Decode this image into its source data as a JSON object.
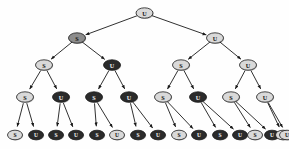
{
  "figure": {
    "background": "#fefefe",
    "edge_color": "#1a1a1a",
    "node_outline": "#1a1a1a"
  },
  "palette": {
    "light": "#d9d9d9",
    "medium": "#8c8c8c",
    "dark": "#2b2b2b",
    "text_on_light": "#111111",
    "text_on_medium": "#111111",
    "text_on_dark": "#f2f2f2"
  },
  "labels": {
    "s": "S",
    "u": "U"
  },
  "levels": [
    {
      "index": 0,
      "y": 13,
      "nodes": [
        {
          "id": "n0",
          "label": "U",
          "shade": "light",
          "x": 144.5
        }
      ]
    },
    {
      "index": 1,
      "y": 38,
      "nodes": [
        {
          "id": "n1",
          "label": "S",
          "shade": "medium",
          "x": 77
        },
        {
          "id": "n2",
          "label": "U",
          "shade": "light",
          "x": 215
        }
      ]
    },
    {
      "index": 2,
      "y": 65,
      "nodes": [
        {
          "id": "n3",
          "label": "S",
          "shade": "light",
          "x": 44
        },
        {
          "id": "n4",
          "label": "U",
          "shade": "dark",
          "x": 112
        },
        {
          "id": "n5",
          "label": "S",
          "shade": "light",
          "x": 181
        },
        {
          "id": "n6",
          "label": "U",
          "shade": "light",
          "x": 248
        }
      ]
    },
    {
      "index": 3,
      "y": 97,
      "nodes": [
        {
          "id": "n7",
          "label": "S",
          "shade": "light",
          "x": 25
        },
        {
          "id": "n8",
          "label": "U",
          "shade": "dark",
          "x": 61
        },
        {
          "id": "n9",
          "label": "S",
          "shade": "dark",
          "x": 94
        },
        {
          "id": "n10",
          "label": "U",
          "shade": "dark",
          "x": 129
        },
        {
          "id": "n11",
          "label": "S",
          "shade": "light",
          "x": 163
        },
        {
          "id": "n12",
          "label": "U",
          "shade": "dark",
          "x": 198
        },
        {
          "id": "n13",
          "label": "S",
          "shade": "light",
          "x": 231
        },
        {
          "id": "n14",
          "label": "U",
          "shade": "light",
          "x": 265
        }
      ]
    },
    {
      "index": 4,
      "y": 135,
      "nodes": [
        {
          "id": "n15",
          "label": "S",
          "shade": "light",
          "x": 15
        },
        {
          "id": "n16",
          "label": "U",
          "shade": "dark",
          "x": 36
        },
        {
          "id": "n17",
          "label": "S",
          "shade": "dark",
          "x": 56
        },
        {
          "id": "n18",
          "label": "U",
          "shade": "dark",
          "x": 76
        },
        {
          "id": "n19",
          "label": "S",
          "shade": "dark",
          "x": 97
        },
        {
          "id": "n20",
          "label": "U",
          "shade": "light",
          "x": 117
        },
        {
          "id": "n21",
          "label": "S",
          "shade": "dark",
          "x": 138
        },
        {
          "id": "n22",
          "label": "U",
          "shade": "dark",
          "x": 158
        },
        {
          "id": "n23",
          "label": "S",
          "shade": "light",
          "x": 179
        },
        {
          "id": "n24",
          "label": "U",
          "shade": "dark",
          "x": 199
        },
        {
          "id": "n25",
          "label": "S",
          "shade": "dark",
          "x": 220
        },
        {
          "id": "n26",
          "label": "U",
          "shade": "dark",
          "x": 240
        },
        {
          "id": "n27",
          "label": "S",
          "shade": "light",
          "x": 255
        },
        {
          "id": "n28",
          "label": "U",
          "shade": "dark",
          "x": 272
        },
        {
          "id": "n29",
          "label": "S",
          "shade": "light",
          "x": 283
        },
        {
          "id": "n30",
          "label": "U",
          "shade": "light",
          "x": 287
        }
      ]
    }
  ],
  "edges": [
    {
      "from": "n0",
      "to": "n1"
    },
    {
      "from": "n0",
      "to": "n2"
    },
    {
      "from": "n1",
      "to": "n3"
    },
    {
      "from": "n1",
      "to": "n4"
    },
    {
      "from": "n2",
      "to": "n5"
    },
    {
      "from": "n2",
      "to": "n6"
    },
    {
      "from": "n3",
      "to": "n7"
    },
    {
      "from": "n3",
      "to": "n8"
    },
    {
      "from": "n4",
      "to": "n9"
    },
    {
      "from": "n4",
      "to": "n10"
    },
    {
      "from": "n5",
      "to": "n11"
    },
    {
      "from": "n5",
      "to": "n12"
    },
    {
      "from": "n6",
      "to": "n13"
    },
    {
      "from": "n6",
      "to": "n14"
    },
    {
      "from": "n7",
      "to": "n15"
    },
    {
      "from": "n7",
      "to": "n16"
    },
    {
      "from": "n8",
      "to": "n17"
    },
    {
      "from": "n8",
      "to": "n18"
    },
    {
      "from": "n9",
      "to": "n19"
    },
    {
      "from": "n9",
      "to": "n20"
    },
    {
      "from": "n10",
      "to": "n21"
    },
    {
      "from": "n10",
      "to": "n22"
    },
    {
      "from": "n11",
      "to": "n23"
    },
    {
      "from": "n11",
      "to": "n24"
    },
    {
      "from": "n12",
      "to": "n25"
    },
    {
      "from": "n12",
      "to": "n26"
    },
    {
      "from": "n13",
      "to": "n27"
    },
    {
      "from": "n13",
      "to": "n28"
    },
    {
      "from": "n14",
      "to": "n29"
    },
    {
      "from": "n14",
      "to": "n30"
    }
  ],
  "node_geometry": {
    "rx": 8.5,
    "ry": 5.2,
    "leaf_rx": 7.5,
    "leaf_ry": 4.8,
    "font_size": 6.2,
    "leaf_font_size": 5.6
  }
}
